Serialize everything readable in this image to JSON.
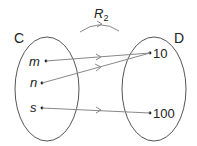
{
  "diagram": {
    "relation_label": "R",
    "relation_subscript": "2",
    "set_left": {
      "name": "C",
      "elements": [
        "m",
        "n",
        "s"
      ]
    },
    "set_right": {
      "name": "D",
      "elements": [
        "10",
        "100"
      ]
    },
    "mappings": [
      {
        "from": "m",
        "to": "10"
      },
      {
        "from": "n",
        "to": "10"
      },
      {
        "from": "s",
        "to": "100"
      }
    ],
    "colors": {
      "outline": "#555555",
      "arrow": "#888888",
      "text": "#222222"
    }
  }
}
